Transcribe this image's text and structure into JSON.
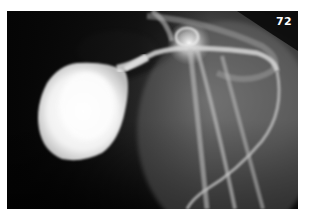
{
  "figure": {
    "number": "72",
    "type": "radiograph"
  },
  "colors": {
    "background": "#0a0a0a",
    "border": "#ffffff",
    "label": "#ffffff"
  }
}
